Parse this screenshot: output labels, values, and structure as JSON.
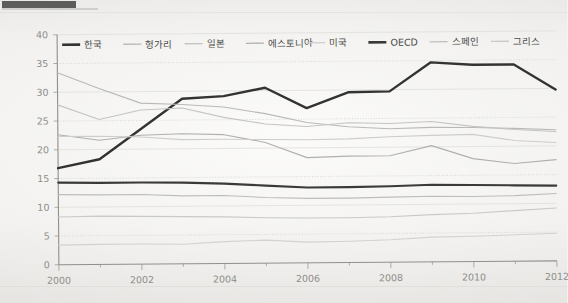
{
  "page": {
    "background_color": "#f3f3f1",
    "top_tab_color": "#3d3d3d"
  },
  "chart_data": {
    "type": "line",
    "title": "",
    "subtitle": "",
    "xlabel": "",
    "ylabel": "",
    "xlim": [
      2000,
      2012
    ],
    "ylim": [
      0,
      40
    ],
    "ytick_step": 5,
    "yticks": [
      "0",
      "5",
      "10",
      "15",
      "20",
      "25",
      "30",
      "35",
      "40"
    ],
    "xticks": [
      "2000",
      "2002",
      "2004",
      "2006",
      "2008",
      "2010",
      "2012"
    ],
    "x": [
      2000,
      2001,
      2002,
      2003,
      2004,
      2005,
      2006,
      2007,
      2008,
      2009,
      2010,
      2011,
      2012
    ],
    "grid": "horizontal",
    "legend_position": "top-inside",
    "series": [
      {
        "name": "한국",
        "color": "#333333",
        "width": 2.4,
        "emphasis": true,
        "values": [
          16.8,
          18.3,
          23.5,
          28.7,
          29.1,
          30.5,
          26.9,
          29.6,
          29.7,
          34.7,
          34.2,
          34.2,
          29.8
        ]
      },
      {
        "name": "헝가리",
        "color": "#b9b9b7",
        "width": 1.1,
        "emphasis": false,
        "values": [
          33.4,
          30.6,
          28.0,
          27.7,
          27.2,
          26.0,
          24.4,
          23.6,
          23.2,
          23.4,
          23.3,
          23.1,
          22.8
        ]
      },
      {
        "name": "일본",
        "color": "#c4c4c2",
        "width": 1.1,
        "emphasis": false,
        "values": [
          27.8,
          25.2,
          26.8,
          27.1,
          25.4,
          24.2,
          23.7,
          24.3,
          24.1,
          24.4,
          23.5,
          22.9,
          22.5
        ]
      },
      {
        "name": "에스토니아",
        "color": "#b0b0ae",
        "width": 1.1,
        "emphasis": false,
        "values": [
          22.6,
          21.6,
          22.4,
          22.6,
          22.4,
          21.0,
          18.3,
          18.5,
          18.5,
          20.2,
          17.9,
          17.0,
          17.6
        ]
      },
      {
        "name": "미국",
        "color": "#cdcdcb",
        "width": 1.1,
        "emphasis": false,
        "values": [
          22.3,
          22.3,
          22.1,
          21.6,
          21.6,
          21.5,
          21.4,
          21.5,
          21.8,
          22.0,
          22.1,
          21.0,
          20.6
        ]
      },
      {
        "name": "OECD",
        "color": "#3a3a3a",
        "width": 2.2,
        "emphasis": true,
        "values": [
          14.3,
          14.2,
          14.2,
          14.1,
          13.9,
          13.5,
          13.1,
          13.1,
          13.2,
          13.4,
          13.3,
          13.2,
          13.1
        ]
      },
      {
        "name": "스페인",
        "color": "#bdbdbb",
        "width": 1.1,
        "emphasis": false,
        "values": [
          12.2,
          12.1,
          12.1,
          11.8,
          11.8,
          11.4,
          11.2,
          11.2,
          11.3,
          11.4,
          11.3,
          11.4,
          11.7
        ]
      },
      {
        "name": "그리스",
        "color": "#c9c9c7",
        "width": 1.1,
        "emphasis": false,
        "values": [
          8.3,
          8.4,
          8.3,
          8.2,
          8.1,
          7.9,
          7.8,
          7.8,
          7.9,
          8.2,
          8.4,
          8.8,
          9.2
        ]
      },
      {
        "name": "하위선",
        "color": "#d2d2d0",
        "width": 1.1,
        "emphasis": false,
        "values": [
          3.4,
          3.5,
          3.5,
          3.4,
          3.8,
          4.0,
          3.6,
          3.7,
          3.9,
          4.3,
          4.4,
          4.6,
          4.8
        ]
      }
    ],
    "legend": [
      "한국",
      "헝가리",
      "일본",
      "에스토니아",
      "미국",
      "OECD",
      "스페인",
      "그리스"
    ]
  }
}
